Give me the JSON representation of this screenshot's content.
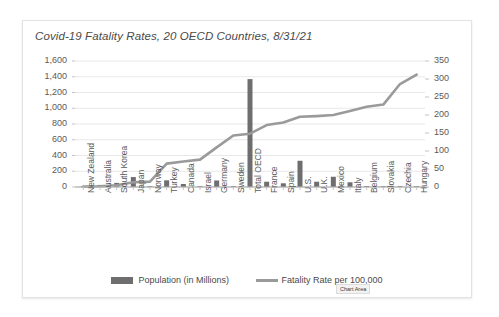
{
  "chart_data": {
    "type": "bar",
    "title": "Covid-19 Fatality Rates, 20 OECD Countries, 8/31/21",
    "xlabel": "",
    "ylabel": "",
    "categories": [
      "New Zealand",
      "Australia",
      "South Korea",
      "Japan",
      "Norway",
      "Turkey",
      "Canada",
      "Israel",
      "Germany",
      "Sweden",
      "Total OECD",
      "France",
      "Spain",
      "U.S.",
      "U.K.",
      "Mexico",
      "Italy",
      "Belgium",
      "Slovakia",
      "Czechia",
      "Hungary"
    ],
    "series": [
      {
        "name": "Population (in Millions)",
        "type": "bar",
        "axis": "left",
        "color": "#6e6e6e",
        "values": [
          5,
          26,
          52,
          126,
          5,
          85,
          38,
          9,
          83,
          10,
          1370,
          67,
          47,
          333,
          67,
          130,
          60,
          12,
          5,
          11,
          10
        ]
      },
      {
        "name": "Fatality Rate per 100,000",
        "type": "line",
        "axis": "right",
        "color": "#9a9a9a",
        "values": [
          1,
          2,
          5,
          13,
          15,
          65,
          71,
          76,
          110,
          143,
          148,
          172,
          179,
          195,
          197,
          200,
          211,
          223,
          229,
          286,
          312
        ]
      }
    ],
    "left_axis": {
      "ticks": [
        "0",
        "200",
        "400",
        "600",
        "800",
        "1,000",
        "1,200",
        "1,400",
        "1,600"
      ],
      "min": 0,
      "max": 1600,
      "step": 200
    },
    "right_axis": {
      "ticks": [
        "0",
        "50",
        "100",
        "150",
        "200",
        "250",
        "300",
        "350"
      ],
      "min": 0,
      "max": 350,
      "step": 50
    },
    "grid": true,
    "legend_position": "bottom",
    "legend": [
      "Population (in Millions)",
      "Fatality Rate per 100,000"
    ]
  },
  "tooltip": {
    "label": "Chart Area"
  }
}
